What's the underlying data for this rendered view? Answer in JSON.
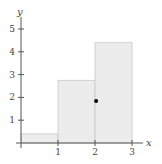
{
  "chart_data": {
    "type": "bar",
    "title": "",
    "xlabel": "x",
    "ylabel": "y",
    "bars": [
      {
        "x_start": 0,
        "x_end": 1,
        "height": 0.4
      },
      {
        "x_start": 1,
        "x_end": 2,
        "height": 2.75
      },
      {
        "x_start": 2,
        "x_end": 3,
        "height": 4.4
      }
    ],
    "point": {
      "x": 2.03,
      "y": 1.84
    },
    "x_ticks": [
      "1",
      "2",
      "3"
    ],
    "y_ticks": [
      "1",
      "2",
      "3",
      "4",
      "5"
    ],
    "xlim": [
      0,
      3.3
    ],
    "ylim": [
      0,
      5.6
    ],
    "grid": false,
    "colors": {
      "bar_fill": "#ececec",
      "bar_stroke": "#c8c8c8",
      "axis": "#555555",
      "point": "#000000"
    }
  }
}
